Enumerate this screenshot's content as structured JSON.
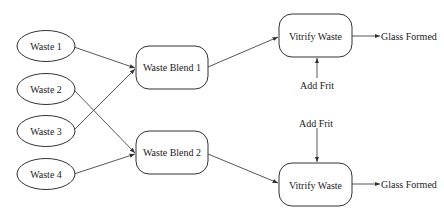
{
  "diagram": {
    "inputs": [
      {
        "id": "waste1",
        "label": "Waste 1",
        "cx": 46,
        "cy": 46
      },
      {
        "id": "waste2",
        "label": "Waste 2",
        "cx": 46,
        "cy": 89
      },
      {
        "id": "waste3",
        "label": "Waste 3",
        "cx": 46,
        "cy": 131
      },
      {
        "id": "waste4",
        "label": "Waste 4",
        "cx": 46,
        "cy": 174
      }
    ],
    "blends": [
      {
        "id": "blend1",
        "label": "Waste Blend 1",
        "x": 136,
        "y": 46,
        "w": 72,
        "h": 43
      },
      {
        "id": "blend2",
        "label": "Waste Blend 2",
        "x": 136,
        "y": 131,
        "w": 72,
        "h": 43
      }
    ],
    "vitrify": [
      {
        "id": "vitrify1",
        "label": "Vitrify Waste",
        "x": 279,
        "y": 14,
        "w": 73,
        "h": 43
      },
      {
        "id": "vitrify2",
        "label": "Vitrify Waste",
        "x": 279,
        "y": 163,
        "w": 73,
        "h": 43
      }
    ],
    "frit": [
      {
        "id": "frit1",
        "label": "Add Frit"
      },
      {
        "id": "frit2",
        "label": "Add Frit"
      }
    ],
    "outputs": [
      {
        "id": "glass1",
        "label": "Glass Formed"
      },
      {
        "id": "glass2",
        "label": "Glass Formed"
      }
    ],
    "edges": [
      {
        "from": "Waste 1",
        "to": "Waste Blend 1"
      },
      {
        "from": "Waste 3",
        "to": "Waste Blend 1"
      },
      {
        "from": "Waste 2",
        "to": "Waste Blend 2"
      },
      {
        "from": "Waste 4",
        "to": "Waste Blend 2"
      },
      {
        "from": "Waste Blend 1",
        "to": "Vitrify Waste (top)"
      },
      {
        "from": "Waste Blend 2",
        "to": "Vitrify Waste (bottom)"
      },
      {
        "from": "Add Frit (top)",
        "to": "Vitrify Waste (top)"
      },
      {
        "from": "Add Frit (bottom)",
        "to": "Vitrify Waste (bottom)"
      },
      {
        "from": "Vitrify Waste (top)",
        "to": "Glass Formed (top)"
      },
      {
        "from": "Vitrify Waste (bottom)",
        "to": "Glass Formed (bottom)"
      }
    ]
  }
}
